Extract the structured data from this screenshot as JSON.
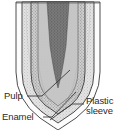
{
  "figure": {
    "background_color": "#ffffff",
    "line_color": "#3a3a3a",
    "text_color": "#2b2b2b"
  },
  "labels": {
    "pulp": "Pulp",
    "enamel": "Enamel",
    "plastic_sleeve_line1": "Plastic",
    "plastic_sleeve_line2": "sleeve"
  },
  "regions": {
    "pulp": {
      "name": "pulp",
      "description": "dark tapering central wedge",
      "fill": "#6e6e6e"
    },
    "dentine": {
      "name": "dentine",
      "description": "mid-gray stippled band around pulp",
      "fill": "#b9b9b9"
    },
    "enamel": {
      "name": "enamel",
      "description": "light stippled outer layer",
      "fill": "#d8d8d8"
    },
    "plastic_sleeve": {
      "name": "plastic-sleeve",
      "description": "outermost thin concentric shell",
      "fill": "#fbfbfb"
    }
  }
}
